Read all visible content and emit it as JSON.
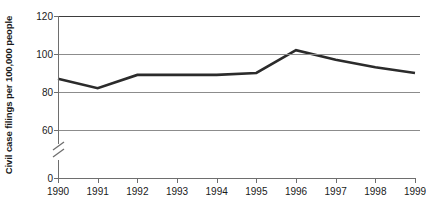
{
  "chart_data": {
    "type": "line",
    "title": "",
    "xlabel": "",
    "ylabel": "Civil case filings per 100,000 people",
    "categories": [
      "1990",
      "1991",
      "1992",
      "1993",
      "1994",
      "1995",
      "1996",
      "1997",
      "1998",
      "1999"
    ],
    "x": [
      1990,
      1991,
      1992,
      1993,
      1994,
      1995,
      1996,
      1997,
      1998,
      1999
    ],
    "values": [
      87,
      82,
      89,
      89,
      89,
      90,
      102,
      97,
      93,
      90
    ],
    "series": [
      {
        "name": "Civil case filings per 100,000 people",
        "values": [
          87,
          82,
          89,
          89,
          89,
          90,
          102,
          97,
          93,
          90
        ]
      }
    ],
    "ylim": [
      60,
      120
    ],
    "yticks": [
      60,
      80,
      100,
      120
    ],
    "ytick_labels": [
      "60",
      "80",
      "100",
      "120"
    ],
    "y_zero_tick": "0",
    "axis_break": true,
    "axis_break_note": "y-axis broken between 0 and 60",
    "grid": "horizontal",
    "legend": "none",
    "line_color": "#2b2b2b",
    "grid_color": "#8c8c8c",
    "axis_color": "#6e6e6e"
  },
  "axis": {
    "y_title": "Civil case filings per 100,000 people",
    "zero_label": "0"
  }
}
